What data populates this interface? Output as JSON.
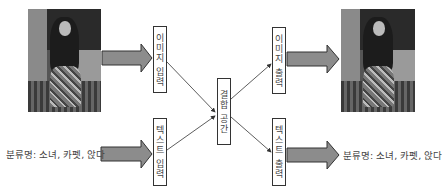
{
  "diagram": {
    "input_image": {
      "icon": "photo-girl-sitting-on-carpet"
    },
    "output_image": {
      "icon": "photo-girl-sitting-on-carpet"
    },
    "boxes": {
      "image_input": "이미지 입력",
      "text_input": "텍스트 입력",
      "joint_space": "결합 공간",
      "image_output": "이미지 출력",
      "text_output": "텍스트 출력"
    },
    "input_caption": "분류명: 소녀, 카펫, 앉다",
    "output_caption": "분류명: 소녀, 카펫, 앉다",
    "colors": {
      "arrow_fill": "#8c8c8c",
      "arrow_stroke": "#333333",
      "line": "#333333",
      "box_border": "#333333"
    }
  }
}
